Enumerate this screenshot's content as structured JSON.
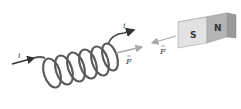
{
  "diagram": {
    "type": "solenoid-and-bar-magnet",
    "labels": {
      "current_in": "i",
      "current_out": "i",
      "force_on_coil": "F",
      "force_on_magnet": "F"
    },
    "magnet": {
      "south_label": "S",
      "north_label": "N"
    },
    "coil_turns": 6,
    "colors": {
      "wire": "#555555",
      "force_arrow": "#aaaaaa",
      "magnet_south": "#e2e2e2",
      "magnet_north": "#b4b4b4",
      "magnet_top": "#ececec",
      "magnet_side": "#999999"
    }
  }
}
